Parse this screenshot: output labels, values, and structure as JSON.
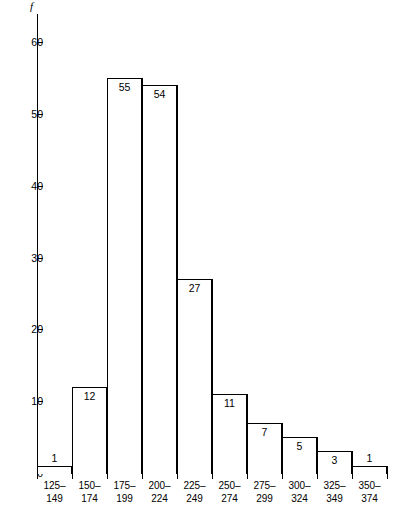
{
  "chart_data": {
    "type": "bar",
    "title": "",
    "subtitle": "",
    "xlabel": "",
    "ylabel": "f",
    "grid": false,
    "legend": false,
    "ylim": [
      0,
      64
    ],
    "yticks": [
      0,
      10,
      20,
      30,
      40,
      50,
      60
    ],
    "ytick_labels": [
      "0",
      "10",
      "20",
      "30",
      "40",
      "50",
      "60"
    ],
    "categories": [
      "125–149",
      "150–174",
      "175–199",
      "200–224",
      "225–249",
      "250–274",
      "275–299",
      "300–324",
      "325–349",
      "350–374"
    ],
    "category_lines": [
      [
        "125–",
        "149"
      ],
      [
        "150–",
        "174"
      ],
      [
        "175–",
        "199"
      ],
      [
        "200–",
        "224"
      ],
      [
        "225–",
        "249"
      ],
      [
        "250–",
        "274"
      ],
      [
        "275–",
        "299"
      ],
      [
        "300–",
        "324"
      ],
      [
        "325–",
        "349"
      ],
      [
        "350–",
        "374"
      ]
    ],
    "values": [
      1,
      12,
      55,
      54,
      27,
      11,
      7,
      5,
      3,
      1
    ],
    "value_labels": [
      "1",
      "12",
      "55",
      "54",
      "27",
      "11",
      "7",
      "5",
      "3",
      "1"
    ],
    "value_label_placement": [
      "outside",
      "inside",
      "inside",
      "inside",
      "inside",
      "inside",
      "inside",
      "inside",
      "inside",
      "outside"
    ],
    "colors": {
      "bar_fill": "#ffffff",
      "bar_stroke": "#000000",
      "axis": "#000000",
      "text": "#000000",
      "background": "#ffffff"
    }
  }
}
